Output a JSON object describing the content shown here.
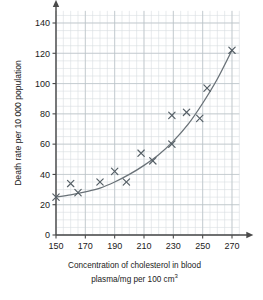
{
  "chart_data": {
    "type": "scatter",
    "title": "",
    "xlabel": "Concentration of cholesterol in blood plasma/mg per 100 cm3",
    "xlabel_line1": "Concentration of cholesterol in blood",
    "xlabel_line2_pre": "plasma/mg per 100 cm",
    "xlabel_line2_sup": "3",
    "ylabel": "Death rate per 10 000 population",
    "xlim": [
      150,
      275
    ],
    "ylim": [
      0,
      148
    ],
    "xticks": [
      150,
      170,
      190,
      210,
      230,
      250,
      270
    ],
    "yticks": [
      0,
      20,
      40,
      60,
      80,
      100,
      120,
      140
    ],
    "xtick_labels": [
      "150",
      "170",
      "190",
      "210",
      "230",
      "250",
      "270"
    ],
    "ytick_labels": [
      "0",
      "20",
      "40",
      "60",
      "80",
      "100",
      "120",
      "140"
    ],
    "grid": true,
    "grid_minor_step_x": 5,
    "grid_minor_step_y": 5,
    "grid_major_step_x": 20,
    "grid_major_step_y": 20,
    "legend": "none",
    "marker": "x",
    "points": [
      {
        "x": 150,
        "y": 25
      },
      {
        "x": 160,
        "y": 34
      },
      {
        "x": 165,
        "y": 28
      },
      {
        "x": 180,
        "y": 35
      },
      {
        "x": 190,
        "y": 42
      },
      {
        "x": 198,
        "y": 35
      },
      {
        "x": 208,
        "y": 54
      },
      {
        "x": 216,
        "y": 49
      },
      {
        "x": 229,
        "y": 60
      },
      {
        "x": 229,
        "y": 79
      },
      {
        "x": 239,
        "y": 81
      },
      {
        "x": 248,
        "y": 77
      },
      {
        "x": 253,
        "y": 97
      },
      {
        "x": 270,
        "y": 122
      }
    ],
    "fit_curve": [
      {
        "x": 150,
        "y": 25
      },
      {
        "x": 160,
        "y": 26.5
      },
      {
        "x": 170,
        "y": 28.5
      },
      {
        "x": 180,
        "y": 31
      },
      {
        "x": 190,
        "y": 35
      },
      {
        "x": 200,
        "y": 40
      },
      {
        "x": 210,
        "y": 46
      },
      {
        "x": 220,
        "y": 53
      },
      {
        "x": 230,
        "y": 62
      },
      {
        "x": 240,
        "y": 73
      },
      {
        "x": 250,
        "y": 87
      },
      {
        "x": 260,
        "y": 103
      },
      {
        "x": 270,
        "y": 122
      }
    ],
    "colors": {
      "marker": "#555f66",
      "curve": "#6a7278",
      "axis": "#4a4a4a",
      "grid_minor": "#d8dde0",
      "grid_major": "#b9c1c6",
      "background": "#ffffff"
    }
  }
}
